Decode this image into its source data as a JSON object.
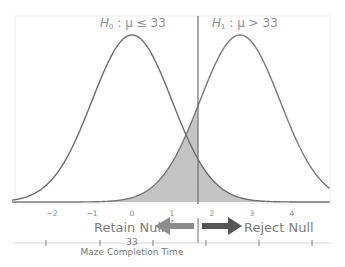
{
  "chart_data": {
    "type": "line",
    "title": "",
    "series": [
      {
        "name": "H0 distribution",
        "mean_z": 0,
        "sd": 1,
        "label": "H₀ : μ ≤ 33"
      },
      {
        "name": "H1 distribution",
        "mean_z": 2.7,
        "sd": 1,
        "label": "H₁ : μ > 33"
      }
    ],
    "critical_value_z": 1.65,
    "shaded_regions": [
      {
        "name": "beta",
        "under": "H1 distribution",
        "side": "left of critical value"
      },
      {
        "name": "alpha",
        "under": "H0 distribution",
        "side": "right of critical value"
      }
    ],
    "x_axis_z": {
      "label": "z",
      "ticks": [
        -2,
        -1,
        0,
        1,
        2,
        3,
        4
      ],
      "range": [
        -3.0,
        4.95
      ]
    },
    "x_axis_raw": {
      "label": "Maze Completion Time",
      "tick_label": "33",
      "tick_label_at_z": 0
    },
    "annotations": [
      "Retain Null",
      "Reject Null"
    ],
    "grid": false,
    "legend": "none"
  },
  "labels": {
    "h0_prefix": "H",
    "h0_sub": "0",
    "h0_rest": " : μ ≤ 33",
    "h1_prefix": "H",
    "h1_sub": "1",
    "h1_rest": " : μ > 33",
    "z_ticks": [
      "−2",
      "−1",
      "0",
      "1",
      "2",
      "3",
      "4"
    ],
    "z_label": "z",
    "retain": "Retain Null",
    "reject": "Reject Null",
    "raw_tick": "33",
    "raw_axis": "Maze Completion Time"
  },
  "colors": {
    "curve": "#6e6e6e",
    "shade": "#c4c4c4",
    "retain_arrow": "#8c8c8c",
    "reject_arrow": "#555555",
    "frame": "#efefef"
  }
}
